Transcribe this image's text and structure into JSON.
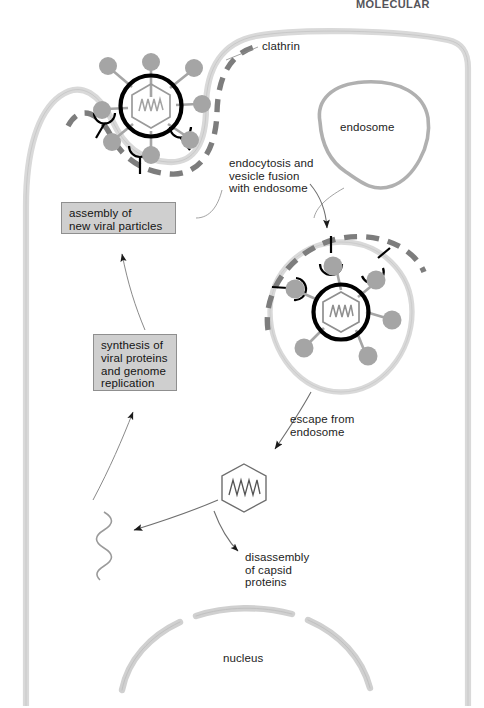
{
  "figure": {
    "header_partial": "MOLECULAR BIOLOGY"
  },
  "labels": {
    "clathrin": "clathrin",
    "endosome": "endosome",
    "endocytosis": "endocytosis and\nvesicle fusion\nwith endosome",
    "escape": "escape from\nendosome",
    "disassembly": "disassembly\nof capsid\nproteins",
    "nucleus": "nucleus"
  },
  "boxes": {
    "assembly": "assembly of\nnew viral particles",
    "synthesis": "synthesis of\nviral proteins\nand genome\nreplication"
  },
  "colors": {
    "membrane_fill": "#d9d9d9",
    "membrane_stroke": "#a8a8a8",
    "clathrin_coat": "#7d7d7d",
    "envelope": "#000000",
    "capsid": "#9a9a9a",
    "spike": "#9a9a9a",
    "receptor": "#000000",
    "genome": "#8c8c8c",
    "box_fill": "#cfcfcf",
    "box_stroke": "#8f8f8f",
    "arrow": "#5a5a5a",
    "nucleus_stroke": "#c2c2c2",
    "text": "#1d1d1d"
  }
}
